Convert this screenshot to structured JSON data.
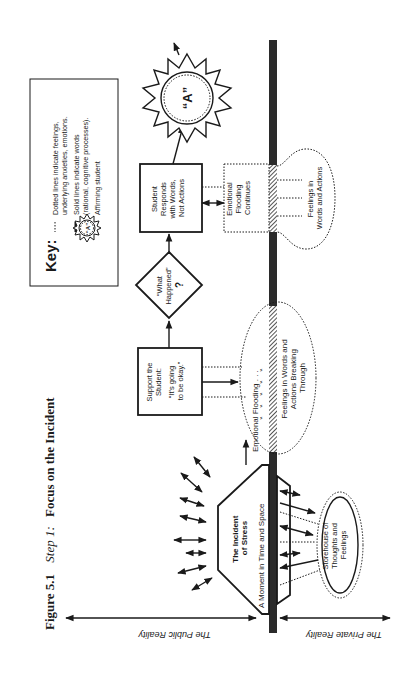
{
  "figure": {
    "number": "Figure 5.1",
    "step": "Step 1:",
    "title": "Focus on the Incident"
  },
  "key": {
    "label": "Key:",
    "dotted": [
      "Dotted lines indicate feelings,",
      "underlying anxieties, emotions."
    ],
    "solid": [
      "Solid lines indicate words",
      "(rational, cognitive processes)."
    ],
    "affirming": "Affirming student",
    "sun_letter": "“A”"
  },
  "nodes": {
    "incident": [
      "The Incident",
      "of Stress"
    ],
    "moment": "A Moment in Time and Space",
    "storehouse": [
      "Storehouse of",
      "Thoughts and",
      "Feelings"
    ],
    "flooding": "Emotional Flooding . . .",
    "breaking": [
      "Feelings in Words and",
      "Actions Breaking",
      "Through"
    ],
    "support": [
      "Support the",
      "Student:",
      "",
      "“It's going",
      "to be okay.”"
    ],
    "what_happened": [
      "“What",
      "Happened”",
      "?"
    ],
    "responds": [
      "Student",
      "Responds",
      "with Words,",
      "Not Actions"
    ],
    "continues": [
      "Emotional",
      "Flooding",
      "Continues"
    ],
    "feelings_words": [
      "Feelings in",
      "Words and Actions"
    ],
    "sun": "“A”"
  },
  "axes": {
    "public": "The Public Reality",
    "private": "The Private Reality"
  },
  "colors": {
    "ink": "#1a1a1a",
    "bar": "#2b2b2b",
    "background": "#ffffff"
  }
}
